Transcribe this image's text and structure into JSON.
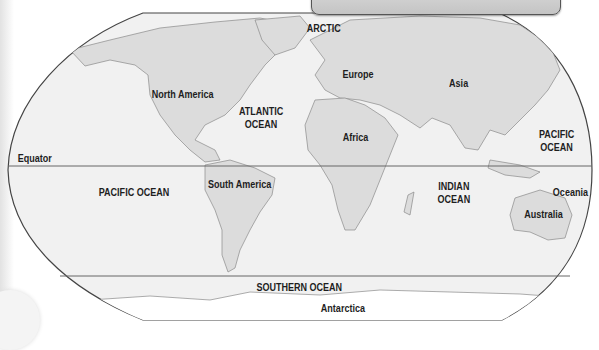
{
  "map": {
    "colors": {
      "ocean": "#f1f1f1",
      "land": "#dcdcdc",
      "border": "#444444",
      "coast": "#8a8a8a",
      "label": "#1e1e1e",
      "header_box": "#cccccc"
    },
    "lines": {
      "equator": "Equator"
    },
    "continents": {
      "north_america": "North America",
      "south_america": "South America",
      "europe": "Europe",
      "asia": "Asia",
      "africa": "Africa",
      "australia": "Australia",
      "oceania": "Oceania",
      "antarctica": "Antarctica"
    },
    "oceans": {
      "arctic": "ARCTIC",
      "atlantic_line1": "ATLANTIC",
      "atlantic_line2": "OCEAN",
      "pacific_west": "PACIFIC OCEAN",
      "pacific_east_line1": "PACIFIC",
      "pacific_east_line2": "OCEAN",
      "indian_line1": "INDIAN",
      "indian_line2": "OCEAN",
      "southern": "SOUTHERN OCEAN"
    }
  }
}
